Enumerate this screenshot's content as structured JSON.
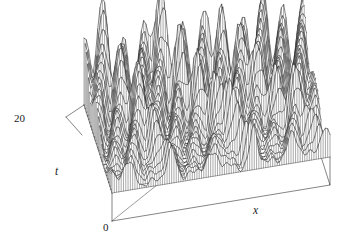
{
  "figure": {
    "kind": "3d-surface-wireframe",
    "background_color": "#ffffff",
    "line_color": "#1f1f1f",
    "width": 356,
    "height": 248
  },
  "axes": {
    "t_axis": {
      "name": "t",
      "max_tick_label": "20",
      "min_tick_label": "0",
      "tick_count": 8
    },
    "x_axis": {
      "name": "x"
    }
  },
  "chart_data": {
    "type": "surface",
    "title": "",
    "xlabel": "x",
    "ylabel": "t",
    "zlabel": "",
    "grid": false,
    "legend": false,
    "xlim": [
      0,
      40
    ],
    "ylim": [
      0,
      20
    ],
    "zlim": [
      0,
      1
    ],
    "nx": 96,
    "nt": 26,
    "x_tick_labels": [],
    "t_tick_labels": [
      "0",
      "20"
    ],
    "projection": {
      "origin_x": 112,
      "origin_y": 193,
      "x_axis_vector": [
        218,
        -36
      ],
      "t_axis_vector": [
        -28,
        -88
      ],
      "z_scale": 112
    },
    "base_box": {
      "front_left": [
        112,
        193
      ],
      "front_right": [
        330,
        157
      ],
      "back_right": [
        302,
        69
      ],
      "back_left": [
        84,
        105
      ],
      "vertical_drop": 28
    },
    "solitons": [
      {
        "amplitude": 0.46,
        "width": 1.55,
        "speed": 0.52,
        "x0": 3.0,
        "phase": 0.0
      },
      {
        "amplitude": 0.62,
        "width": 1.15,
        "speed": -0.38,
        "x0": 11.0,
        "phase": 0.0
      },
      {
        "amplitude": 0.4,
        "width": 1.85,
        "speed": 0.74,
        "x0": 18.5,
        "phase": 0.0
      },
      {
        "amplitude": 0.78,
        "width": 0.95,
        "speed": -0.66,
        "x0": 26.0,
        "phase": 0.0
      },
      {
        "amplitude": 0.52,
        "width": 1.4,
        "speed": 0.44,
        "x0": 33.0,
        "phase": 0.0
      },
      {
        "amplitude": 0.58,
        "width": 1.1,
        "speed": -0.8,
        "x0": 39.0,
        "phase": 0.0
      }
    ],
    "modulation": {
      "carrier_k": 0.86,
      "carrier_omega": 0.31,
      "envelope_growth": 0.055,
      "noise_k1": 2.3,
      "noise_k2": 1.37,
      "noise_amp": 0.085
    }
  }
}
